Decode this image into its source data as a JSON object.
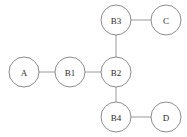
{
  "diagram": {
    "type": "node-link-graph",
    "width": 187,
    "height": 137,
    "background_color": "#ffffff",
    "node_fill_color": "#ffffff",
    "node_stroke_color": "#8c8c8c",
    "edge_color": "#9a9a9a",
    "label_color": "#2b2b2b",
    "node_radius": 15,
    "nodes": [
      {
        "id": "B3",
        "label": "B3",
        "cx": 116,
        "cy": 20
      },
      {
        "id": "C",
        "label": "C",
        "cx": 166,
        "cy": 20
      },
      {
        "id": "A",
        "label": "A",
        "cx": 24,
        "cy": 72
      },
      {
        "id": "B1",
        "label": "B1",
        "cx": 70,
        "cy": 72
      },
      {
        "id": "B2",
        "label": "B2",
        "cx": 116,
        "cy": 72
      },
      {
        "id": "B4",
        "label": "B4",
        "cx": 116,
        "cy": 117
      },
      {
        "id": "D",
        "label": "D",
        "cx": 166,
        "cy": 117
      }
    ],
    "edges": [
      {
        "id": "A-B1",
        "source": "A",
        "target": "B1",
        "x1": 39,
        "y1": 72,
        "x2": 55,
        "y2": 72
      },
      {
        "id": "B1-B2",
        "source": "B1",
        "target": "B2",
        "x1": 85,
        "y1": 72,
        "x2": 101,
        "y2": 72
      },
      {
        "id": "B2-B3",
        "source": "B2",
        "target": "B3",
        "x1": 116,
        "y1": 57,
        "x2": 116,
        "y2": 35
      },
      {
        "id": "B3-C",
        "source": "B3",
        "target": "C",
        "x1": 131,
        "y1": 20,
        "x2": 151,
        "y2": 20
      },
      {
        "id": "B2-B4",
        "source": "B2",
        "target": "B4",
        "x1": 116,
        "y1": 87,
        "x2": 116,
        "y2": 102
      },
      {
        "id": "B4-D",
        "source": "B4",
        "target": "D",
        "x1": 131,
        "y1": 117,
        "x2": 151,
        "y2": 117
      }
    ]
  }
}
